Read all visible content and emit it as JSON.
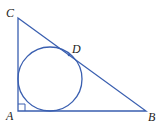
{
  "diagram": {
    "colors": {
      "stroke": "#3a5fb0",
      "label": "#222222",
      "point": "#3a5fb0"
    },
    "vertices": {
      "A": {
        "label": "A"
      },
      "B": {
        "label": "B"
      },
      "C": {
        "label": "C"
      }
    },
    "tangent_point": {
      "label": "D"
    },
    "right_angle_at": "A"
  }
}
